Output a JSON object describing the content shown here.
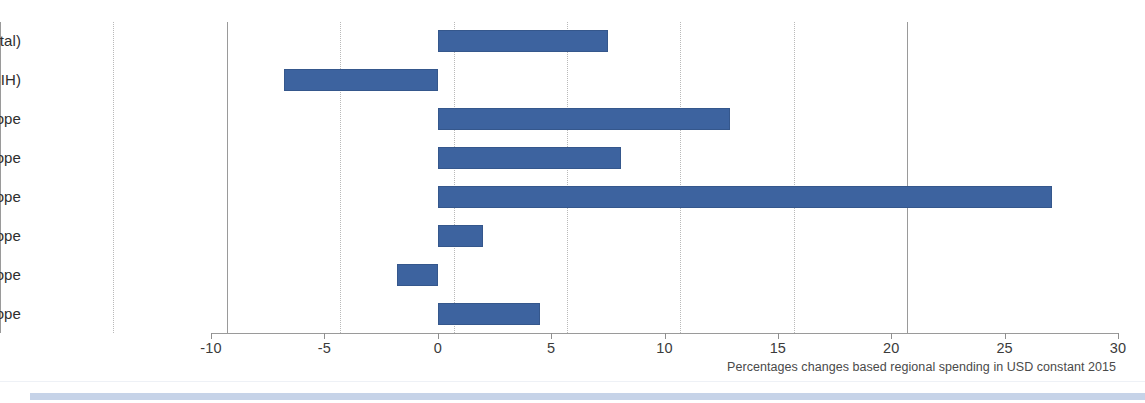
{
  "chart_data": {
    "type": "bar",
    "orientation": "horizontal",
    "title": "",
    "subtitle": "",
    "xlabel": "Percentages changes based regional spending in USD constant 2015",
    "ylabel": "",
    "xlim": [
      -10,
      30
    ],
    "ylim": null,
    "grid": true,
    "legend": false,
    "legend_position": "none",
    "bar_color": "#3d639f",
    "categories": [
      "Balkans (total)",
      "Balkans (excluding BIH)",
      "Central Europe",
      "Northern Europe",
      "Southeastern Europe",
      "Southern Europe",
      "Western Europe",
      "Total Europe"
    ],
    "values": [
      7.5,
      -6.8,
      12.9,
      8.1,
      27.1,
      2.0,
      -1.8,
      4.5
    ],
    "xticks": [
      -10,
      -5,
      0,
      5,
      10,
      15,
      20,
      25,
      30
    ],
    "xtick_labels": [
      "-10",
      "-5",
      "0",
      "5",
      "10",
      "15",
      "20",
      "25",
      "30"
    ]
  },
  "caption": "Percentages changes based regional spending in USD constant 2015",
  "colors": {
    "bar": "#3d639f",
    "bar_edge": "#35578c",
    "gridline": "#b9b9b9",
    "axis": "#9a9a9a",
    "footer_accent": "#c6d3e8",
    "text": "#2e2e2e"
  }
}
